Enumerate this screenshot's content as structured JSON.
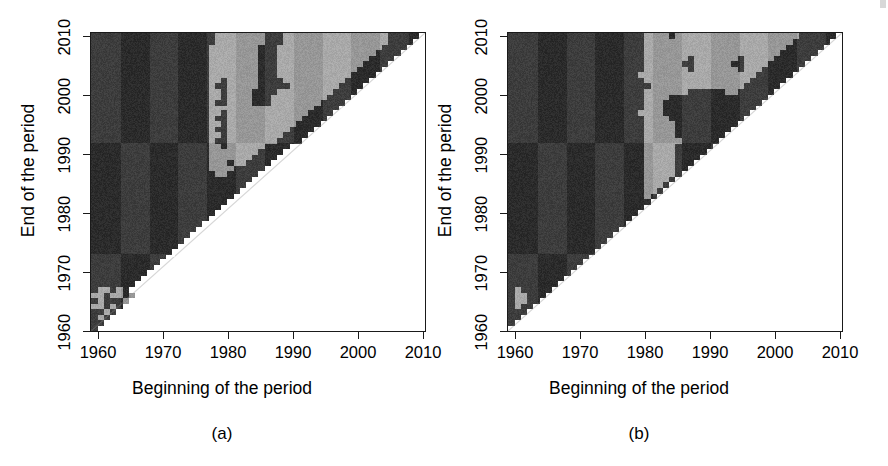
{
  "figure": {
    "background_color": "#ffffff",
    "width": 888,
    "height": 466
  },
  "panels": [
    {
      "id": "a",
      "caption": "(a)",
      "xaxis_title": "Beginning of the period",
      "yaxis_title": "End of the period",
      "xtick_labels": [
        "1960",
        "1970",
        "1980",
        "1990",
        "2000",
        "2010"
      ],
      "ytick_labels": [
        "1960",
        "1970",
        "1980",
        "1990",
        "2000",
        "2010"
      ]
    },
    {
      "id": "b",
      "caption": "(b)",
      "xaxis_title": "Beginning of the period",
      "yaxis_title": "End of the period",
      "xtick_labels": [
        "1960",
        "1970",
        "1980",
        "1990",
        "2000",
        "2010"
      ],
      "ytick_labels": [
        "1960",
        "1970",
        "1980",
        "1990",
        "2000",
        "2010"
      ]
    }
  ],
  "colors": {
    "dark": "#3d3d3d",
    "light": "#a9a9a9",
    "blank": "#ffffff",
    "axis": "#1a1a1a",
    "text": "#000000"
  },
  "chart_data": [
    {
      "type": "heatmap",
      "panel": "a",
      "title": "(a)",
      "xlabel": "Beginning of the period",
      "ylabel": "End of the period",
      "xlim": [
        1957,
        2011
      ],
      "ylim": [
        1957,
        2011
      ],
      "xticks": [
        1960,
        1970,
        1980,
        1990,
        2000,
        2010
      ],
      "yticks": [
        1960,
        1970,
        1980,
        1990,
        2000,
        2010
      ],
      "grid": false,
      "legend": "none",
      "value_levels": [
        {
          "name": "dark",
          "color": "#3d3d3d"
        },
        {
          "name": "light",
          "color": "#a9a9a9"
        },
        {
          "name": "blank",
          "color": "#ffffff"
        }
      ],
      "note": "Upper-left triangle filled; lower-right (end < begin) blank. Rows listed top (end=2011) to bottom (end=1957); columns left (begin=1957) to right (begin=2011). Values: 0=dark, 1=light, 2=blank.",
      "x_start": 1957,
      "y_top": 2011,
      "cell_years": 1,
      "ncols": 54,
      "nrows": 54,
      "regions": [
        {
          "label": "dark-main-left",
          "x_range": [
            1957,
            1975
          ],
          "y_range": [
            1957,
            2011
          ],
          "value": 0
        },
        {
          "label": "mixed-transition-band",
          "x_range": [
            1975,
            1983
          ],
          "y_range": [
            1990,
            2011
          ],
          "value": "mixed"
        },
        {
          "label": "light-upper-right",
          "x_range": [
            1983,
            2008
          ],
          "y_range": [
            1988,
            2011
          ],
          "value": 1
        },
        {
          "label": "dark-top-strip",
          "x_range": [
            1994,
            2009
          ],
          "y_range": [
            2006,
            2011
          ],
          "value": 0
        },
        {
          "label": "light-lower-left-patch",
          "x_range": [
            1957,
            1964
          ],
          "y_range": [
            1961,
            1967
          ],
          "value": 1
        },
        {
          "label": "blank-lower-triangle",
          "x_range": [
            1957,
            2011
          ],
          "y_range": [
            1957,
            2011
          ],
          "value": 2
        }
      ],
      "grid_rows": [
        "000000000000000000001111111100011111111111111111000002",
        "000000000000000000001111111100011111111111111111000022",
        "000000000000000000011111111000111111111111111110000222",
        "000000000000000000011111111000111111111111111100002222",
        "000000000000000000011111111000111111111111111000022222",
        "000000000000000000011111111000111111111111110000222222",
        "000000000000000000011111111000111111111111100002222222",
        "000000000000000000011111111000111111111111000022222222",
        "000000000000000000011011111000011111111110000222222222",
        "000000000000000000010011111000001111111100002222222222",
        "000000000000000000011011110000111111111000022222222222",
        "000000000000000000011011110001111111110000222222222222",
        "000000000000000000010011110001111111100002222222222222",
        "000000000000000000011111111111111111000022222222222222",
        "000000000000000000011011111111111110000222222222222222",
        "000000000000000000010011111111111100002222222222222222",
        "000000000000000000011011111111111000022222222222222222",
        "000000000000000000010011111111110000222222222222222222",
        "000000000000000000011011111111100002222222222222222222",
        "000000000000000000010011111111000022222222222222222222",
        "000000000000000000011011111100002222222222222222222222",
        "000000000000000000011111111000022222222222222222222222",
        "000000000000000000011111110000222222222222222222222222",
        "000000000000000000011101100002222222222222222222222222",
        "000000000000000000011110000022222222222222222222222222",
        "000000000000000000001100000222222222222222222222222222",
        "000000000000000000000000002222222222222222222222222222",
        "000000000000000000000000022222222222222222222222222222",
        "000000000000000000000000222222222222222222222222222222",
        "000000000000000000000002222222222222222222222222222222",
        "000000000000000000000022222222222222222222222222222222",
        "000000000000000000000222222222222222222222222222222222",
        "000000000000000000002222222222222222222222222222222222",
        "000000000000000000022222222222222222222222222222222222",
        "000000000000000000222222222222222222222222222222222222",
        "000000000000000002222222222222222222222222222222222222",
        "000000000000000022222222222222222222222222222222222222",
        "000000000000000222222222222222222222222222222222222222",
        "000000000000002222222222222222222222222222222222222222",
        "000000000000022222222222222222222222222222222222222222",
        "000000000000222222222222222222222222222222222222222222",
        "000000000002222222222222222222222222222222222222222222",
        "000000000022222222222222222222222222222222222222222222",
        "000000000222222222222222222222222222222222222222222222",
        "000000002222222222222222222222222222222222222222222222",
        "000000022222222222222222222222222222222222222222222222",
        "011010222222222222222222222222222222222222222222222222",
        "110110122222222222222222222222222222222222222222222222",
        "010001222222222222222222222222222222222222222222222222",
        "110102222222222222222222222222222222222222222222222222",
        "001022222222222222222222222222222222222222222222222222",
        "010222222222222222222222222222222222222222222222222222",
        "002222222222222222222222222222222222222222222222222222",
        "022222222222222222222222222222222222222222222222222222"
      ]
    },
    {
      "type": "heatmap",
      "panel": "b",
      "title": "(b)",
      "xlabel": "Beginning of the period",
      "ylabel": "End of the period",
      "xlim": [
        1957,
        2011
      ],
      "ylim": [
        1957,
        2011
      ],
      "xticks": [
        1960,
        1970,
        1980,
        1990,
        2000,
        2010
      ],
      "yticks": [
        1960,
        1970,
        1980,
        1990,
        2000,
        2010
      ],
      "grid": false,
      "legend": "none",
      "value_levels": [
        {
          "name": "dark",
          "color": "#3d3d3d"
        },
        {
          "name": "light",
          "color": "#a9a9a9"
        },
        {
          "name": "blank",
          "color": "#ffffff"
        }
      ],
      "note": "Upper-left triangle filled; lower-right (end < begin) blank. Rows listed top (end=2011) to bottom (end=1957); columns left (begin=1957) to right (begin=2011). Values: 0=dark, 1=light, 2=blank.",
      "x_start": 1957,
      "y_top": 2011,
      "cell_years": 1,
      "ncols": 54,
      "nrows": 54,
      "regions": [
        {
          "label": "dark-main-left",
          "x_range": [
            1957,
            1980
          ],
          "y_range": [
            1957,
            2011
          ],
          "value": 0
        },
        {
          "label": "light-upper-right",
          "x_range": [
            1980,
            2008
          ],
          "y_range": [
            2002,
            2011
          ],
          "value": 1
        },
        {
          "label": "dark-mid-band",
          "x_range": [
            1986,
            2005
          ],
          "y_range": [
            1993,
            2002
          ],
          "value": 0
        },
        {
          "label": "light-finger",
          "x_range": [
            1980,
            1986
          ],
          "y_range": [
            1988,
            2002
          ],
          "value": 1
        },
        {
          "label": "light-lower-left-patch",
          "x_range": [
            1958,
            1961
          ],
          "y_range": [
            1962,
            1966
          ],
          "value": 1
        },
        {
          "label": "blank-lower-triangle",
          "x_range": [
            1957,
            2011
          ],
          "y_range": [
            1957,
            2011
          ],
          "value": 2
        }
      ],
      "grid_rows": [
        "000000000000000000000011110111111111111111111110000002",
        "000000000000000000000011111111111111111111111100000022",
        "000000000000000000000011111111111111111111111000000222",
        "000000000000000000000011111111111111111111110000002222",
        "000000000000000000000011111110111111101111100000022222",
        "000000000000000000000011111100111111001111000000222222",
        "000000000000000000000011111110111111101110000002222222",
        "000000000000000000000111111111111111111100000022222222",
        "000000000000000000000011111111111111111000000222222222",
        "000000000000000000000001111111111111110000002222222222",
        "000000000000000000000011111110000001100000022222222222",
        "000000000000000000000011110000000000000000222222222222",
        "000000000000000000000011100000000000000002222222222222",
        "000000000000000000000011100000000000000022222222222222",
        "000000000000000000000111100000000000000222222222222222",
        "000000000000000000000011110000000000002222222222222222",
        "000000000000000000000011111000000000022222222222222222",
        "000000000000000000000011111000000000222222222222222222",
        "000000000000000000000011111000000002222222222222222222",
        "000000000000000000000011111100000022222222222222222222",
        "000000000000000000000011111000000222222222222222222222",
        "000000000000000000000011111000002222222222222222222222",
        "000000000000000000000011111000022222222222222222222222",
        "000000000000000000000011111000222222222222222222222222",
        "000000000000000000000011111002222222222222222222222222",
        "000000000000000000000011111022222222222222222222222222",
        "000000000000000000000011110222222222222222222222222222",
        "000000000000000000000011102222222222222222222222222222",
        "000000000000000000000011022222222222222222222222222222",
        "000000000000000000000010222222222222222222222222222222",
        "000000000000000000000002222222222222222222222222222222",
        "000000000000000000000022222222222222222222222222222222",
        "000000000000000000000222222222222222222222222222222222",
        "000000000000000000002222222222222222222222222222222222",
        "000000000000000000022222222222222222222222222222222222",
        "000000000000000000222222222222222222222222222222222222",
        "000000000000000002222222222222222222222222222222222222",
        "000000000000000022222222222222222222222222222222222222",
        "000000000000000222222222222222222222222222222222222222",
        "000000000000002222222222222222222222222222222222222222",
        "000000000000022222222222222222222222222222222222222222",
        "000000000000222222222222222222222222222222222222222222",
        "000000000002222222222222222222222222222222222222222222",
        "000000000022222222222222222222222222222222222222222222",
        "000000000222222222222222222222222222222222222222222222",
        "000000002222222222222222222222222222222222222222222222",
        "010000022222222222222222222222222222222222222222222222",
        "011000222222222222222222222222222222222222222222222222",
        "011002222222222222222222222222222222222222222222222222",
        "010022222222222222222222222222222222222222222222222222",
        "000222222222222222222222222222222222222222222222222222",
        "002222222222222222222222222222222222222222222222222222",
        "022222222222222222222222222222222222222222222222222222",
        "222222222222222222222222222222222222222222222222222222"
      ]
    }
  ]
}
